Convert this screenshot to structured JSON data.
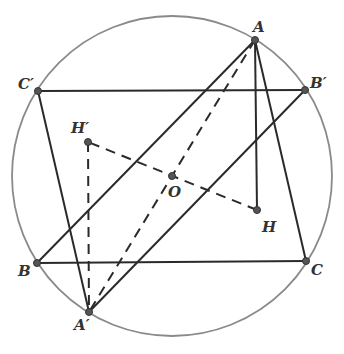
{
  "diagram": {
    "type": "geometry",
    "circle": {
      "cx": 172,
      "cy": 176,
      "r": 160,
      "color": "#777777"
    },
    "points": {
      "A": {
        "label": "A",
        "x": 255,
        "y": 40
      },
      "B": {
        "label": "B",
        "x": 37,
        "y": 263
      },
      "C": {
        "label": "C",
        "x": 306,
        "y": 261
      },
      "A'": {
        "label": "A′",
        "x": 89,
        "y": 312
      },
      "B'": {
        "label": "B′",
        "x": 305,
        "y": 90
      },
      "C'": {
        "label": "C′",
        "x": 38,
        "y": 91
      },
      "H": {
        "label": "H",
        "x": 257,
        "y": 210
      },
      "H'": {
        "label": "H′",
        "x": 88,
        "y": 142
      },
      "O": {
        "label": "O",
        "x": 172,
        "y": 176
      }
    },
    "solid_segments": [
      [
        "A",
        "B"
      ],
      [
        "A",
        "C"
      ],
      [
        "B",
        "C"
      ],
      [
        "A'",
        "B'"
      ],
      [
        "A'",
        "C'"
      ],
      [
        "B'",
        "C'"
      ],
      [
        "A",
        "H"
      ]
    ],
    "dashed_segments": [
      [
        "A",
        "A'"
      ],
      [
        "H",
        "H'"
      ],
      [
        "A'",
        "H'"
      ]
    ],
    "labels": [
      "A",
      "B",
      "C",
      "A′",
      "B′",
      "C′",
      "H",
      "H′",
      "O"
    ]
  }
}
